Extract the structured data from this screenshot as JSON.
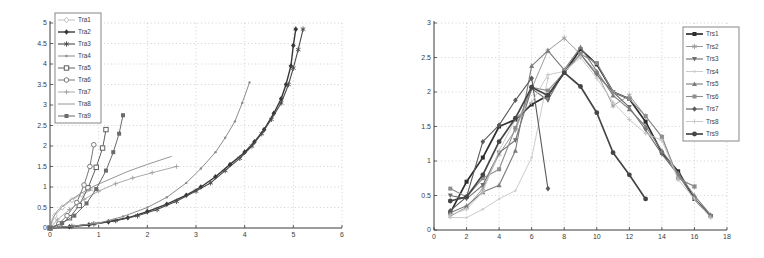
{
  "page": {
    "background": "#ffffff"
  },
  "colors": {
    "axis": "#3a3a3a",
    "grid": "#bdbdbd",
    "tick_text": "#3c3c3c",
    "legend_border": "#7a7a7a",
    "legend_bg": "#ffffff"
  },
  "chart_data": [
    {
      "type": "line",
      "title": "",
      "xlabel": "",
      "ylabel": "",
      "xlim": [
        0,
        6
      ],
      "ylim": [
        0,
        5
      ],
      "xticks": [
        0,
        1,
        2,
        3,
        4,
        5,
        6
      ],
      "yticks": [
        0,
        0.5,
        1,
        1.5,
        2,
        2.5,
        3,
        3.5,
        4,
        4.5,
        5
      ],
      "grid": true,
      "legend_position": "top-left",
      "series": [
        {
          "name": "Tra1",
          "color": "#c0c0c0",
          "width": 1.0,
          "marker": "diamond-open",
          "points": [
            [
              0,
              0
            ],
            [
              0.1,
              0.3
            ],
            [
              0.25,
              0.5
            ],
            [
              0.45,
              0.68
            ],
            [
              0.65,
              0.82
            ],
            [
              0.9,
              0.95
            ]
          ]
        },
        {
          "name": "Tra2",
          "color": "#383838",
          "width": 1.4,
          "marker": "diamond-filled",
          "points": [
            [
              0,
              0
            ],
            [
              0.4,
              0.03
            ],
            [
              0.8,
              0.08
            ],
            [
              1.2,
              0.15
            ],
            [
              1.6,
              0.25
            ],
            [
              2.0,
              0.4
            ],
            [
              2.4,
              0.58
            ],
            [
              2.8,
              0.8
            ],
            [
              3.1,
              1.0
            ],
            [
              3.4,
              1.25
            ],
            [
              3.7,
              1.55
            ],
            [
              4.0,
              1.85
            ],
            [
              4.2,
              2.1
            ],
            [
              4.4,
              2.4
            ],
            [
              4.6,
              2.8
            ],
            [
              4.75,
              3.15
            ],
            [
              4.85,
              3.5
            ],
            [
              4.95,
              3.95
            ],
            [
              5.0,
              4.45
            ],
            [
              5.05,
              4.85
            ]
          ]
        },
        {
          "name": "Tra3",
          "color": "#4a4a4a",
          "width": 1.1,
          "marker": "star",
          "points": [
            [
              0,
              0
            ],
            [
              0.45,
              0.04
            ],
            [
              0.9,
              0.1
            ],
            [
              1.35,
              0.18
            ],
            [
              1.8,
              0.3
            ],
            [
              2.2,
              0.45
            ],
            [
              2.6,
              0.65
            ],
            [
              3.0,
              0.9
            ],
            [
              3.3,
              1.1
            ],
            [
              3.6,
              1.4
            ],
            [
              3.9,
              1.7
            ],
            [
              4.15,
              2.0
            ],
            [
              4.35,
              2.3
            ],
            [
              4.55,
              2.65
            ],
            [
              4.75,
              3.05
            ],
            [
              4.9,
              3.5
            ],
            [
              5.0,
              3.9
            ],
            [
              5.1,
              4.35
            ],
            [
              5.2,
              4.85
            ]
          ]
        },
        {
          "name": "Tra4",
          "color": "#8c8c8c",
          "width": 1.0,
          "marker": "dot",
          "points": [
            [
              0,
              0
            ],
            [
              0.5,
              0.05
            ],
            [
              1.0,
              0.12
            ],
            [
              1.5,
              0.28
            ],
            [
              2.0,
              0.5
            ],
            [
              2.4,
              0.75
            ],
            [
              2.8,
              1.1
            ],
            [
              3.1,
              1.45
            ],
            [
              3.4,
              1.85
            ],
            [
              3.6,
              2.2
            ],
            [
              3.8,
              2.6
            ],
            [
              3.95,
              3.05
            ],
            [
              4.1,
              3.55
            ]
          ]
        },
        {
          "name": "Tra5",
          "color": "#5f5f5f",
          "width": 1.0,
          "marker": "square-open",
          "points": [
            [
              0,
              0
            ],
            [
              0.2,
              0.08
            ],
            [
              0.4,
              0.25
            ],
            [
              0.6,
              0.55
            ],
            [
              0.78,
              0.98
            ],
            [
              0.95,
              1.48
            ],
            [
              1.08,
              1.95
            ],
            [
              1.15,
              2.4
            ]
          ]
        },
        {
          "name": "Tra6",
          "color": "#787878",
          "width": 1.0,
          "marker": "circle-open",
          "points": [
            [
              0,
              0
            ],
            [
              0.18,
              0.1
            ],
            [
              0.35,
              0.3
            ],
            [
              0.55,
              0.62
            ],
            [
              0.7,
              1.05
            ],
            [
              0.82,
              1.5
            ],
            [
              0.9,
              2.03
            ]
          ]
        },
        {
          "name": "Tra7",
          "color": "#a0a0a0",
          "width": 0.9,
          "marker": "plus",
          "points": [
            [
              0,
              0
            ],
            [
              0.15,
              0.2
            ],
            [
              0.4,
              0.45
            ],
            [
              0.7,
              0.7
            ],
            [
              1.0,
              0.9
            ],
            [
              1.35,
              1.08
            ],
            [
              1.7,
              1.22
            ],
            [
              2.1,
              1.35
            ],
            [
              2.6,
              1.5
            ]
          ]
        },
        {
          "name": "Tra8",
          "color": "#8a8a8a",
          "width": 0.9,
          "marker": "none",
          "points": [
            [
              0,
              0
            ],
            [
              0.05,
              0.22
            ],
            [
              0.15,
              0.42
            ],
            [
              0.35,
              0.62
            ],
            [
              0.6,
              0.82
            ],
            [
              0.9,
              1.02
            ],
            [
              1.25,
              1.2
            ],
            [
              1.6,
              1.38
            ],
            [
              2.0,
              1.55
            ],
            [
              2.5,
              1.75
            ]
          ]
        },
        {
          "name": "Tra9",
          "color": "#6b6b6b",
          "width": 1.0,
          "marker": "square-filled",
          "points": [
            [
              0,
              0
            ],
            [
              0.25,
              0.12
            ],
            [
              0.5,
              0.3
            ],
            [
              0.75,
              0.6
            ],
            [
              0.95,
              0.95
            ],
            [
              1.15,
              1.4
            ],
            [
              1.3,
              1.85
            ],
            [
              1.42,
              2.3
            ],
            [
              1.5,
              2.75
            ]
          ]
        }
      ]
    },
    {
      "type": "line",
      "title": "",
      "xlabel": "",
      "ylabel": "",
      "xlim": [
        0,
        18
      ],
      "ylim": [
        0,
        3
      ],
      "xticks": [
        0,
        2,
        4,
        6,
        8,
        10,
        12,
        14,
        16,
        18
      ],
      "yticks": [
        0,
        0.5,
        1,
        1.5,
        2,
        2.5,
        3
      ],
      "grid": true,
      "legend_position": "right",
      "series": [
        {
          "name": "Trs1",
          "color": "#2e2e2e",
          "width": 1.7,
          "marker": "square-filled",
          "points": [
            [
              1,
              0.25
            ],
            [
              2,
              0.7
            ],
            [
              3,
              1.05
            ],
            [
              4,
              1.5
            ],
            [
              5,
              1.6
            ],
            [
              6,
              1.82
            ],
            [
              7,
              1.95
            ],
            [
              8,
              2.28
            ],
            [
              9,
              2.62
            ],
            [
              10,
              2.4
            ],
            [
              11,
              2.0
            ],
            [
              12,
              1.9
            ],
            [
              13,
              1.57
            ],
            [
              14,
              1.12
            ],
            [
              15,
              0.85
            ],
            [
              16,
              0.45
            ],
            [
              17,
              0.2
            ]
          ]
        },
        {
          "name": "Trs2",
          "color": "#9b9b9b",
          "width": 1.0,
          "marker": "star",
          "points": [
            [
              1,
              0.2
            ],
            [
              2,
              0.33
            ],
            [
              3,
              0.6
            ],
            [
              4,
              1.1
            ],
            [
              5,
              1.45
            ],
            [
              6,
              2.05
            ],
            [
              7,
              2.6
            ],
            [
              8,
              2.78
            ],
            [
              9,
              2.55
            ],
            [
              10,
              2.28
            ],
            [
              11,
              1.8
            ],
            [
              12,
              1.95
            ],
            [
              13,
              1.65
            ],
            [
              14,
              1.35
            ],
            [
              15,
              0.75
            ],
            [
              16,
              0.63
            ]
          ]
        },
        {
          "name": "Trs3",
          "color": "#6e6e6e",
          "width": 1.1,
          "marker": "triangle-down",
          "points": [
            [
              1,
              0.5
            ],
            [
              2,
              0.45
            ],
            [
              3,
              0.65
            ],
            [
              4,
              1.12
            ],
            [
              5,
              1.3
            ],
            [
              6,
              2.05
            ],
            [
              7,
              1.88
            ],
            [
              8,
              2.3
            ],
            [
              9,
              2.55
            ],
            [
              10,
              2.25
            ],
            [
              11,
              2.0
            ],
            [
              12,
              1.78
            ],
            [
              13,
              1.45
            ],
            [
              14,
              1.1
            ],
            [
              15,
              0.8
            ],
            [
              16,
              0.45
            ],
            [
              17,
              0.2
            ]
          ]
        },
        {
          "name": "Trs4",
          "color": "#cccccc",
          "width": 1.0,
          "marker": "dot",
          "points": [
            [
              1,
              0.18
            ],
            [
              2,
              0.18
            ],
            [
              3,
              0.3
            ],
            [
              4,
              0.45
            ],
            [
              5,
              0.57
            ],
            [
              6,
              1.05
            ],
            [
              7,
              2.2
            ]
          ]
        },
        {
          "name": "Trs5",
          "color": "#7c7c7c",
          "width": 1.1,
          "marker": "triangle-up",
          "points": [
            [
              1,
              0.25
            ],
            [
              2,
              0.35
            ],
            [
              3,
              0.55
            ],
            [
              4,
              0.65
            ],
            [
              5,
              1.15
            ],
            [
              6,
              2.38
            ],
            [
              7,
              2.6
            ],
            [
              8,
              2.32
            ],
            [
              9,
              2.65
            ],
            [
              10,
              2.3
            ],
            [
              11,
              1.95
            ],
            [
              12,
              1.75
            ],
            [
              13,
              1.5
            ],
            [
              14,
              1.15
            ],
            [
              15,
              0.82
            ],
            [
              16,
              0.5
            ],
            [
              17,
              0.22
            ]
          ]
        },
        {
          "name": "Trs6",
          "color": "#8d8d8d",
          "width": 1.1,
          "marker": "square-filled",
          "points": [
            [
              1,
              0.6
            ],
            [
              2,
              0.48
            ],
            [
              3,
              0.75
            ],
            [
              4,
              0.88
            ],
            [
              5,
              1.48
            ],
            [
              6,
              2.07
            ],
            [
              7,
              2.02
            ],
            [
              8,
              2.28
            ],
            [
              9,
              2.55
            ],
            [
              10,
              2.42
            ],
            [
              11,
              2.0
            ],
            [
              12,
              1.9
            ],
            [
              13,
              1.65
            ],
            [
              14,
              1.35
            ],
            [
              15,
              0.75
            ],
            [
              16,
              0.63
            ]
          ]
        },
        {
          "name": "Trs7",
          "color": "#5a5a5a",
          "width": 1.1,
          "marker": "diamond-filled",
          "points": [
            [
              1,
              0.28
            ],
            [
              2,
              0.48
            ],
            [
              3,
              1.28
            ],
            [
              4,
              1.52
            ],
            [
              5,
              1.88
            ],
            [
              6,
              2.2
            ],
            [
              7,
              0.6
            ]
          ]
        },
        {
          "name": "Trs8",
          "color": "#c4c4c4",
          "width": 0.9,
          "marker": "plus",
          "points": [
            [
              1,
              0.22
            ],
            [
              2,
              0.3
            ],
            [
              3,
              0.55
            ],
            [
              4,
              1.15
            ],
            [
              5,
              1.6
            ],
            [
              6,
              1.85
            ],
            [
              7,
              2.25
            ],
            [
              8,
              2.3
            ],
            [
              9,
              2.5
            ],
            [
              10,
              2.2
            ],
            [
              11,
              1.85
            ],
            [
              12,
              1.6
            ],
            [
              13,
              1.4
            ],
            [
              14,
              1.3
            ],
            [
              15,
              0.73
            ],
            [
              16,
              0.45
            ],
            [
              17,
              0.18
            ]
          ]
        },
        {
          "name": "Trs9",
          "color": "#454545",
          "width": 1.7,
          "marker": "circle-filled",
          "points": [
            [
              1,
              0.42
            ],
            [
              2,
              0.48
            ],
            [
              3,
              0.8
            ],
            [
              4,
              1.28
            ],
            [
              5,
              1.62
            ],
            [
              6,
              2.07
            ],
            [
              7,
              1.95
            ],
            [
              8,
              2.28
            ],
            [
              9,
              2.08
            ],
            [
              10,
              1.7
            ],
            [
              11,
              1.12
            ],
            [
              12,
              0.8
            ],
            [
              13,
              0.45
            ]
          ]
        }
      ]
    }
  ]
}
